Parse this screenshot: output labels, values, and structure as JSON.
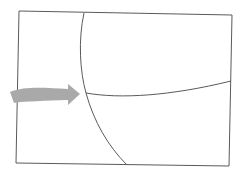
{
  "diagram": {
    "colors": {
      "background": "#ffffff",
      "outline": "#5a5a5a",
      "arrow": "#a9a9a9"
    },
    "outline": {
      "points": [
        [
          19,
          11
        ],
        [
          232,
          15
        ],
        [
          229,
          166
        ],
        [
          16,
          163
        ]
      ]
    },
    "vertical_curve": {
      "start": [
        84,
        13
      ],
      "junction": [
        86,
        93
      ],
      "end": [
        127,
        165
      ]
    },
    "horizontal_curve": {
      "start": [
        86,
        93
      ],
      "end": [
        231,
        81
      ]
    },
    "arrow": {
      "direction": "right",
      "tail_x": 10,
      "tip": [
        80,
        94
      ]
    }
  }
}
